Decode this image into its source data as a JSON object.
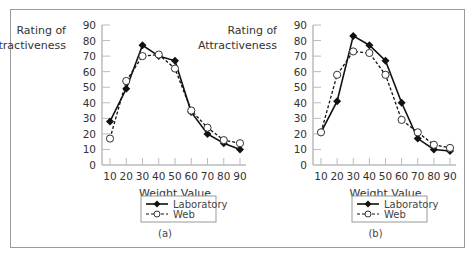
{
  "chart_data": [
    {
      "type": "line",
      "panel_label": "(a)",
      "ylabel_line1": "Rating of",
      "ylabel_line2": "Attractiveness",
      "xlabel": "Weight Value",
      "x": [
        10,
        20,
        30,
        40,
        50,
        60,
        70,
        80,
        90
      ],
      "xticks": [
        "10",
        "20",
        "30",
        "40",
        "50",
        "60",
        "70",
        "80",
        "90"
      ],
      "yticks": [
        "0",
        "10",
        "20",
        "30",
        "40",
        "50",
        "60",
        "70",
        "80",
        "90"
      ],
      "ylim": [
        0,
        90
      ],
      "xlim": [
        10,
        90
      ],
      "legend_position": "bottom-center",
      "series": [
        {
          "name": "Laboratory",
          "marker": "filled-diamond",
          "line": "solid",
          "values": [
            28,
            49,
            77,
            70,
            67,
            34,
            20,
            14,
            10
          ]
        },
        {
          "name": "Web",
          "marker": "open-circle",
          "line": "dashed",
          "values": [
            17,
            54,
            70,
            71,
            62,
            35,
            24,
            16,
            14
          ]
        }
      ]
    },
    {
      "type": "line",
      "panel_label": "(b)",
      "ylabel_line1": "Rating of",
      "ylabel_line2": "Attractiveness",
      "xlabel": "Weight Value",
      "x": [
        10,
        20,
        30,
        40,
        50,
        60,
        70,
        80,
        90
      ],
      "xticks": [
        "10",
        "20",
        "30",
        "40",
        "50",
        "60",
        "70",
        "80",
        "90"
      ],
      "yticks": [
        "0",
        "10",
        "20",
        "30",
        "40",
        "50",
        "60",
        "70",
        "80",
        "90"
      ],
      "ylim": [
        0,
        90
      ],
      "xlim": [
        10,
        90
      ],
      "legend_position": "bottom-center",
      "series": [
        {
          "name": "Laboratory",
          "marker": "filled-diamond",
          "line": "solid",
          "values": [
            21,
            41,
            83,
            77,
            67,
            40,
            17,
            10,
            9
          ]
        },
        {
          "name": "Web",
          "marker": "open-circle",
          "line": "dashed",
          "values": [
            21,
            58,
            73,
            72,
            58,
            29,
            21,
            13,
            11
          ]
        }
      ]
    }
  ]
}
